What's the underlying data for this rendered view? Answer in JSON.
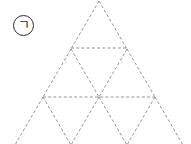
{
  "figure": {
    "label": "ㄱ",
    "label_circled": "㈠",
    "background_color": "#ffffff",
    "line_color": "#8a8a93",
    "line_width": 0.9,
    "dash_pattern": "3,2.2",
    "label_color": "#2b2b2b",
    "canvas": {
      "width": 191,
      "height": 144
    },
    "geometry": {
      "apex": {
        "x": 99,
        "y": 1
      },
      "row_height": 48,
      "half_width_step": 28,
      "rows": 4,
      "rows_visible": 3.9,
      "horizontal_lines": [
        {
          "row": 1,
          "y": 48,
          "x1": 71,
          "x2": 127
        },
        {
          "row": 2,
          "y": 97,
          "x1": 43,
          "x2": 155
        },
        {
          "row": 3,
          "y": 145,
          "x1": 15,
          "x2": 183,
          "cropped": true
        }
      ],
      "vertices": [
        {
          "row": 0,
          "points": [
            {
              "x": 99,
              "y": 1
            }
          ]
        },
        {
          "row": 1,
          "points": [
            {
              "x": 71,
              "y": 48
            },
            {
              "x": 127,
              "y": 48
            }
          ]
        },
        {
          "row": 2,
          "points": [
            {
              "x": 43,
              "y": 97
            },
            {
              "x": 99,
              "y": 97
            },
            {
              "x": 155,
              "y": 97
            }
          ]
        },
        {
          "row": 3,
          "points": [
            {
              "x": 15,
              "y": 145
            },
            {
              "x": 71,
              "y": 145
            },
            {
              "x": 127,
              "y": 145
            },
            {
              "x": 183,
              "y": 145
            }
          ]
        }
      ]
    }
  }
}
